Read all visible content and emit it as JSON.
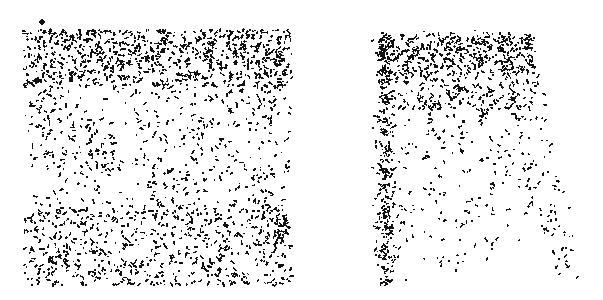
{
  "figure": {
    "title": "",
    "background_color": "#ffffff",
    "mark_color": "#111111",
    "width": 603,
    "height": 300,
    "panel_count": 2
  },
  "panels": [
    {
      "id": "left",
      "name": "isotropic-speckle-panel",
      "label": "",
      "bounds": {
        "x": 24,
        "y": 30,
        "width": 268,
        "height": 255
      },
      "pattern": "isotropic-scatter",
      "description": "Dense random speckle field filling a square region, denser along the top band and fading into reticulated clumps toward the lower middle",
      "mark_count": 1650,
      "outlier_dot": {
        "x": 42,
        "y": 22,
        "radius": 2.6
      }
    },
    {
      "id": "right",
      "name": "anisotropic-streak-panel",
      "label": "",
      "bounds": {
        "x": 375,
        "y": 30,
        "width": 200,
        "height": 255
      },
      "pattern": "vertical-streaks",
      "description": "Dense horizontal band across the top from which near-vertical and diagonal streaks of specks descend, thinning toward the bottom",
      "mark_count": 1150,
      "top_band": {
        "x": 378,
        "y": 33,
        "width": 157,
        "height": 42
      }
    }
  ],
  "chart_data": {
    "type": "scatter",
    "title": "",
    "xlabel": "",
    "ylabel": "",
    "grid": false,
    "legend": null,
    "axes_visible": false,
    "tick_labels": [],
    "series": [
      {
        "name": "left-panel-isotropic-field",
        "panel": "left",
        "color": "#111111",
        "marker": "short-dash",
        "n_points": 1650,
        "xlim": [
          24,
          292
        ],
        "ylim": [
          30,
          285
        ],
        "density_profile": {
          "top_band_y": [
            30,
            85
          ],
          "top_band_density": 1.0,
          "mid_density": 0.55,
          "bottom_density": 0.7
        },
        "clump_centers": [
          [
            52,
            48
          ],
          [
            96,
            44
          ],
          [
            148,
            52
          ],
          [
            196,
            46
          ],
          [
            244,
            44
          ],
          [
            276,
            56
          ],
          [
            62,
            78
          ],
          [
            118,
            72
          ],
          [
            170,
            84
          ],
          [
            222,
            70
          ],
          [
            268,
            80
          ],
          [
            44,
            120
          ],
          [
            92,
            132
          ],
          [
            148,
            118
          ],
          [
            196,
            128
          ],
          [
            250,
            112
          ],
          [
            282,
            140
          ],
          [
            56,
            166
          ],
          [
            104,
            158
          ],
          [
            160,
            172
          ],
          [
            214,
            160
          ],
          [
            262,
            176
          ],
          [
            48,
            210
          ],
          [
            100,
            220
          ],
          [
            152,
            206
          ],
          [
            204,
            224
          ],
          [
            256,
            212
          ],
          [
            284,
            228
          ],
          [
            60,
            256
          ],
          [
            112,
            264
          ],
          [
            168,
            252
          ],
          [
            220,
            268
          ],
          [
            268,
            258
          ]
        ]
      },
      {
        "name": "right-panel-streaks",
        "panel": "right",
        "color": "#111111",
        "marker": "short-dash",
        "n_points": 1150,
        "xlim": [
          375,
          575
        ],
        "ylim": [
          30,
          285
        ],
        "streaks": [
          {
            "x_top": 384,
            "y_top": 34,
            "x_bottom": 386,
            "y_bottom": 285,
            "weight": 1.0
          },
          {
            "x_top": 406,
            "y_top": 34,
            "x_bottom": 402,
            "y_bottom": 278,
            "weight": 0.55
          },
          {
            "x_top": 428,
            "y_top": 34,
            "x_bottom": 438,
            "y_bottom": 282,
            "weight": 0.75
          },
          {
            "x_top": 452,
            "y_top": 36,
            "x_bottom": 470,
            "y_bottom": 272,
            "weight": 0.6
          },
          {
            "x_top": 474,
            "y_top": 34,
            "x_bottom": 496,
            "y_bottom": 250,
            "weight": 0.45
          },
          {
            "x_top": 502,
            "y_top": 36,
            "x_bottom": 540,
            "y_bottom": 240,
            "weight": 0.5
          },
          {
            "x_top": 524,
            "y_top": 34,
            "x_bottom": 572,
            "y_bottom": 284,
            "weight": 0.55
          }
        ]
      }
    ]
  }
}
